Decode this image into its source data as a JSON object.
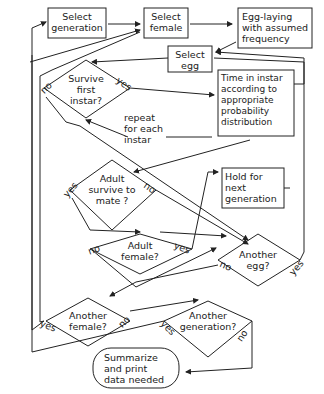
{
  "nodes": {
    "select_generation": "Select\ngeneration",
    "select_female": "Select\nfemale",
    "egg_laying": "Egg-laying\nwith assumed\nfrequency",
    "select_egg": "Select\negg",
    "survive_first_instar": "Survive\nfirst\ninstar?",
    "time_in_instar": "Time in instar\naccording to\nappropriate\nprobability\ndistribution",
    "repeat_note": "repeat\nfor each\ninstar",
    "adult_survive": "Adult\nsurvive to\nmate ?",
    "hold_next_gen": "Hold for\nnext\ngeneration",
    "adult_female": "Adult\nfemale?",
    "another_egg": "Another\negg?",
    "another_female": "Another\nfemale?",
    "another_generation": "Another\ngeneration?",
    "summarize": "Summarize\nand print\ndata needed"
  },
  "edge_labels": {
    "yes": "yes",
    "no": "no"
  }
}
